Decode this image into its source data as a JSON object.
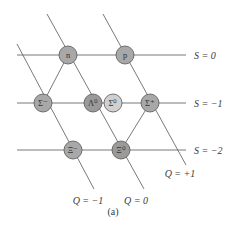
{
  "diagram": {
    "caption": "(a)",
    "strangeness_labels": [
      {
        "text": "S = 0",
        "y": 55
      },
      {
        "text": "S = −1",
        "y": 103
      },
      {
        "text": "S = −2",
        "y": 150
      }
    ],
    "charge_labels": [
      {
        "text": "Q = −1",
        "x": 88,
        "y": 204
      },
      {
        "text": "Q = 0",
        "x": 136,
        "y": 204
      },
      {
        "text": "Q = +1",
        "x": 180,
        "y": 177
      }
    ],
    "particles": [
      {
        "id": "n",
        "label": "n",
        "x": 68,
        "y": 55,
        "color": "#a8a8a8"
      },
      {
        "id": "p",
        "label": "p",
        "x": 125,
        "y": 55,
        "color": "#a8a8a8"
      },
      {
        "id": "sigma-minus",
        "label": "Σ⁻",
        "x": 43,
        "y": 103,
        "color": "#a8a8a8"
      },
      {
        "id": "lambda-zero",
        "label": "Λ⁰",
        "x": 93,
        "y": 103,
        "color": "#9a9a9a"
      },
      {
        "id": "sigma-zero",
        "label": "Σ⁰",
        "x": 113,
        "y": 103,
        "color": "#d0d0d0"
      },
      {
        "id": "sigma-plus",
        "label": "Σ⁺",
        "x": 150,
        "y": 103,
        "color": "#a8a8a8"
      },
      {
        "id": "xi-minus",
        "label": "Ξ⁻",
        "x": 73,
        "y": 150,
        "color": "#a8a8a8"
      },
      {
        "id": "xi-zero",
        "label": "Ξ⁰",
        "x": 121,
        "y": 150,
        "color": "#9a9a9a"
      }
    ],
    "line_color": "#6a6a6a"
  }
}
